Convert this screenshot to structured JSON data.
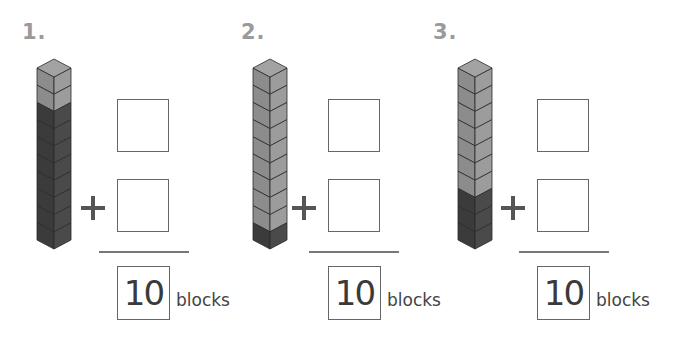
{
  "colors": {
    "light_left": "#8c8c8c",
    "light_right": "#9c9c9c",
    "light_top": "#a3a3a3",
    "dark_left": "#3b3b3b",
    "dark_right": "#4a4a4a",
    "dark_top": "#555555",
    "edge": "#2a2a2a"
  },
  "problems": [
    {
      "label": "1.",
      "light_blocks": 2,
      "dark_blocks": 8,
      "total": "10",
      "unit": "blocks",
      "operator": "+",
      "answer_top": "",
      "answer_bottom": ""
    },
    {
      "label": "2.",
      "light_blocks": 9,
      "dark_blocks": 1,
      "total": "10",
      "unit": "blocks",
      "operator": "+",
      "answer_top": "",
      "answer_bottom": ""
    },
    {
      "label": "3.",
      "light_blocks": 7,
      "dark_blocks": 3,
      "total": "10",
      "unit": "blocks",
      "operator": "+",
      "answer_top": "",
      "answer_bottom": ""
    }
  ]
}
